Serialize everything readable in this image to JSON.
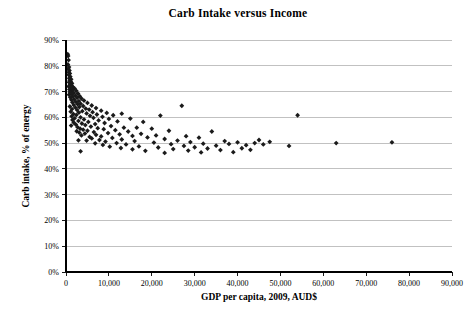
{
  "chart_data": {
    "type": "scatter",
    "title": "Carb Intake versus Income",
    "xlabel": "GDP per capita, 2009, AUD$",
    "ylabel": "Carb intake, % of energy",
    "xlim": [
      0,
      90000
    ],
    "ylim": [
      0,
      0.9
    ],
    "grid": "horizontal",
    "legend": "none",
    "marker": "diamond",
    "marker_color": "#1a1a1a",
    "x_ticks": [
      0,
      10000,
      20000,
      30000,
      40000,
      50000,
      60000,
      70000,
      80000,
      90000
    ],
    "x_tick_labels": [
      "0",
      "10,000",
      "20,000",
      "30,000",
      "40,000",
      "50,000",
      "60,000",
      "70,000",
      "80,000",
      "90,000"
    ],
    "y_ticks": [
      0,
      0.1,
      0.2,
      0.3,
      0.4,
      0.5,
      0.6,
      0.7,
      0.8,
      0.9
    ],
    "y_tick_labels": [
      "0%",
      "10%",
      "20%",
      "30%",
      "40%",
      "50%",
      "60%",
      "70%",
      "80%",
      "90%"
    ],
    "points": [
      [
        400,
        0.845
      ],
      [
        500,
        0.838
      ],
      [
        600,
        0.822
      ],
      [
        450,
        0.805
      ],
      [
        700,
        0.795
      ],
      [
        520,
        0.788
      ],
      [
        800,
        0.782
      ],
      [
        650,
        0.775
      ],
      [
        900,
        0.77
      ],
      [
        600,
        0.765
      ],
      [
        1000,
        0.758
      ],
      [
        750,
        0.752
      ],
      [
        1200,
        0.748
      ],
      [
        850,
        0.744
      ],
      [
        1100,
        0.74
      ],
      [
        700,
        0.736
      ],
      [
        1400,
        0.732
      ],
      [
        950,
        0.728
      ],
      [
        1300,
        0.724
      ],
      [
        600,
        0.72
      ],
      [
        1600,
        0.718
      ],
      [
        1050,
        0.714
      ],
      [
        2000,
        0.712
      ],
      [
        800,
        0.708
      ],
      [
        1500,
        0.706
      ],
      [
        2400,
        0.703
      ],
      [
        1150,
        0.7
      ],
      [
        900,
        0.698
      ],
      [
        1800,
        0.695
      ],
      [
        2800,
        0.692
      ],
      [
        1350,
        0.69
      ],
      [
        700,
        0.688
      ],
      [
        2200,
        0.685
      ],
      [
        3200,
        0.682
      ],
      [
        1600,
        0.68
      ],
      [
        1000,
        0.678
      ],
      [
        2600,
        0.676
      ],
      [
        3600,
        0.673
      ],
      [
        1900,
        0.67
      ],
      [
        1250,
        0.668
      ],
      [
        4200,
        0.665
      ],
      [
        3000,
        0.663
      ],
      [
        2300,
        0.66
      ],
      [
        1500,
        0.658
      ],
      [
        5000,
        0.656
      ],
      [
        3400,
        0.653
      ],
      [
        2700,
        0.651
      ],
      [
        1800,
        0.648
      ],
      [
        6000,
        0.646
      ],
      [
        4000,
        0.644
      ],
      [
        900,
        0.642
      ],
      [
        3100,
        0.64
      ],
      [
        2200,
        0.638
      ],
      [
        7000,
        0.636
      ],
      [
        4600,
        0.634
      ],
      [
        1400,
        0.632
      ],
      [
        5400,
        0.63
      ],
      [
        2600,
        0.628
      ],
      [
        8200,
        0.626
      ],
      [
        3800,
        0.624
      ],
      [
        1100,
        0.622
      ],
      [
        6200,
        0.62
      ],
      [
        3000,
        0.618
      ],
      [
        9500,
        0.617
      ],
      [
        4800,
        0.615
      ],
      [
        1700,
        0.613
      ],
      [
        7200,
        0.611
      ],
      [
        2400,
        0.609
      ],
      [
        11000,
        0.608
      ],
      [
        5600,
        0.606
      ],
      [
        1300,
        0.604
      ],
      [
        8500,
        0.602
      ],
      [
        3400,
        0.6
      ],
      [
        13000,
        0.614
      ],
      [
        6400,
        0.598
      ],
      [
        2000,
        0.596
      ],
      [
        10000,
        0.594
      ],
      [
        4200,
        0.592
      ],
      [
        1500,
        0.59
      ],
      [
        7600,
        0.588
      ],
      [
        27000,
        0.645
      ],
      [
        22000,
        0.607
      ],
      [
        2900,
        0.586
      ],
      [
        12000,
        0.584
      ],
      [
        5200,
        0.582
      ],
      [
        1800,
        0.58
      ],
      [
        9000,
        0.578
      ],
      [
        3700,
        0.576
      ],
      [
        15000,
        0.595
      ],
      [
        6800,
        0.574
      ],
      [
        2300,
        0.572
      ],
      [
        18000,
        0.582
      ],
      [
        4500,
        0.57
      ],
      [
        1200,
        0.568
      ],
      [
        10500,
        0.566
      ],
      [
        5800,
        0.564
      ],
      [
        2700,
        0.562
      ],
      [
        13500,
        0.56
      ],
      [
        7400,
        0.558
      ],
      [
        3300,
        0.556
      ],
      [
        16500,
        0.56
      ],
      [
        8800,
        0.554
      ],
      [
        4000,
        0.552
      ],
      [
        20000,
        0.556
      ],
      [
        11500,
        0.55
      ],
      [
        5000,
        0.548
      ],
      [
        2500,
        0.546
      ],
      [
        14500,
        0.545
      ],
      [
        6500,
        0.543
      ],
      [
        3100,
        0.541
      ],
      [
        24000,
        0.548
      ],
      [
        9800,
        0.539
      ],
      [
        4400,
        0.537
      ],
      [
        17500,
        0.536
      ],
      [
        12500,
        0.534
      ],
      [
        7000,
        0.532
      ],
      [
        3600,
        0.53
      ],
      [
        21000,
        0.53
      ],
      [
        15500,
        0.528
      ],
      [
        8200,
        0.526
      ],
      [
        5500,
        0.524
      ],
      [
        28000,
        0.527
      ],
      [
        19000,
        0.522
      ],
      [
        10800,
        0.52
      ],
      [
        6000,
        0.518
      ],
      [
        31000,
        0.521
      ],
      [
        23000,
        0.516
      ],
      [
        13000,
        0.514
      ],
      [
        7800,
        0.512
      ],
      [
        4800,
        0.51
      ],
      [
        34000,
        0.545
      ],
      [
        26000,
        0.51
      ],
      [
        16000,
        0.508
      ],
      [
        9200,
        0.506
      ],
      [
        2900,
        0.511
      ],
      [
        37000,
        0.508
      ],
      [
        29000,
        0.504
      ],
      [
        20500,
        0.502
      ],
      [
        11800,
        0.5
      ],
      [
        6800,
        0.499
      ],
      [
        40000,
        0.503
      ],
      [
        32000,
        0.498
      ],
      [
        24500,
        0.496
      ],
      [
        14000,
        0.495
      ],
      [
        8600,
        0.493
      ],
      [
        42000,
        0.492
      ],
      [
        35000,
        0.49
      ],
      [
        27500,
        0.489
      ],
      [
        17000,
        0.487
      ],
      [
        10200,
        0.486
      ],
      [
        44000,
        0.5
      ],
      [
        38000,
        0.497
      ],
      [
        30000,
        0.484
      ],
      [
        21500,
        0.483
      ],
      [
        12800,
        0.481
      ],
      [
        46000,
        0.495
      ],
      [
        41000,
        0.48
      ],
      [
        33000,
        0.479
      ],
      [
        25000,
        0.477
      ],
      [
        15500,
        0.476
      ],
      [
        47500,
        0.505
      ],
      [
        43000,
        0.474
      ],
      [
        36000,
        0.473
      ],
      [
        28500,
        0.471
      ],
      [
        18500,
        0.47
      ],
      [
        3400,
        0.468
      ],
      [
        54000,
        0.608
      ],
      [
        52000,
        0.489
      ],
      [
        63000,
        0.5
      ],
      [
        76000,
        0.503
      ],
      [
        45000,
        0.512
      ],
      [
        39000,
        0.465
      ],
      [
        31500,
        0.464
      ],
      [
        23000,
        0.462
      ]
    ]
  }
}
